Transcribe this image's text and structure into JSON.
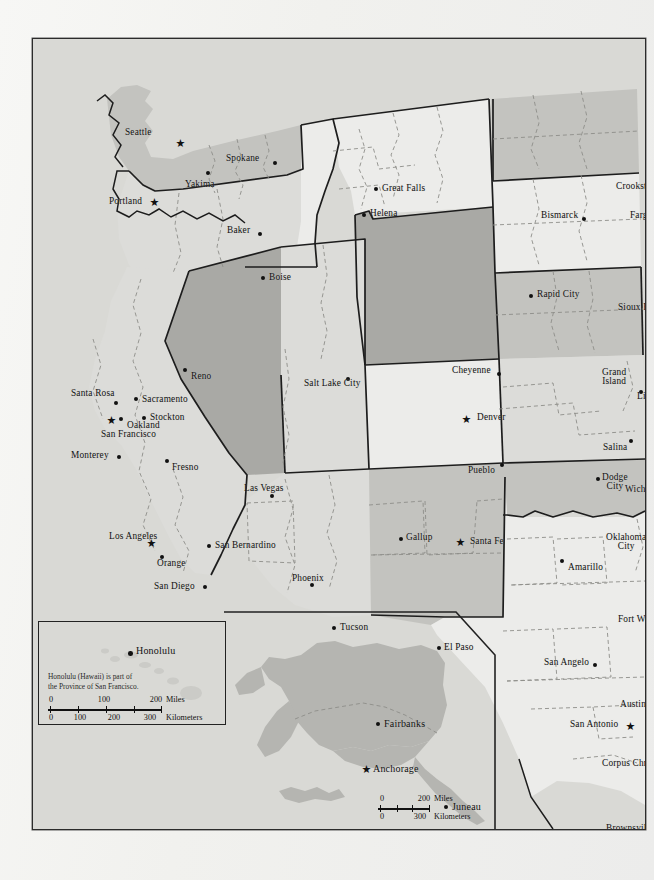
{
  "document": {
    "title": "Western United States Political Map",
    "type": "printed-atlas-page",
    "paper_color": "#f2f2ef",
    "frame_border_color": "#2b2b2b"
  },
  "palette": {
    "fill_lightest": "#ececea",
    "fill_light": "#dcdcd9",
    "fill_medium": "#c4c4c0",
    "fill_dark": "#a9a9a5",
    "base": "#d9d9d5",
    "ink": "#111111",
    "dashed_border": "#8a8a86"
  },
  "map": {
    "cities": [
      {
        "name": "Seattle",
        "x": 148,
        "y": 104,
        "marker": "star",
        "label_x": 92,
        "label_y": 89,
        "align": "left"
      },
      {
        "name": "Spokane",
        "x": 242,
        "y": 124,
        "marker": "dot",
        "label_x": 193,
        "label_y": 115,
        "align": "left"
      },
      {
        "name": "Yakima",
        "x": 175,
        "y": 134,
        "marker": "dot",
        "label_x": 152,
        "label_y": 141,
        "align": "left"
      },
      {
        "name": "Portland",
        "x": 122,
        "y": 163,
        "marker": "star",
        "label_x": 76,
        "label_y": 158,
        "align": "left"
      },
      {
        "name": "Baker",
        "x": 227,
        "y": 195,
        "marker": "dot",
        "label_x": 194,
        "label_y": 187,
        "align": "left"
      },
      {
        "name": "Boise",
        "x": 230,
        "y": 239,
        "marker": "dot",
        "label_x": 236,
        "label_y": 234,
        "align": "left"
      },
      {
        "name": "Great Falls",
        "x": 343,
        "y": 150,
        "marker": "dot",
        "label_x": 349,
        "label_y": 145,
        "align": "left"
      },
      {
        "name": "Helena",
        "x": 331,
        "y": 176,
        "marker": "dot",
        "label_x": 337,
        "label_y": 170,
        "align": "left"
      },
      {
        "name": "Crookston",
        "x": 634,
        "y": 152,
        "marker": "dot",
        "label_x": 583,
        "label_y": 143,
        "align": "left"
      },
      {
        "name": "Bismarck",
        "x": 551,
        "y": 180,
        "marker": "dot",
        "label_x": 508,
        "label_y": 172,
        "align": "left"
      },
      {
        "name": "Fargo",
        "x": 628,
        "y": 180,
        "marker": "dot",
        "label_x": 597,
        "label_y": 172,
        "align": "left"
      },
      {
        "name": "Rapid City",
        "x": 498,
        "y": 257,
        "marker": "dot",
        "label_x": 504,
        "label_y": 251,
        "align": "left"
      },
      {
        "name": "Sioux Falls",
        "x": 638,
        "y": 272,
        "marker": "dot",
        "label_x": 585,
        "label_y": 264,
        "align": "left"
      },
      {
        "name": "Cheyenne",
        "x": 466,
        "y": 335,
        "marker": "dot",
        "label_x": 419,
        "label_y": 327,
        "align": "left"
      },
      {
        "name": "Grand\nIsland",
        "x": 608,
        "y": 353,
        "marker": "dot",
        "label_x": 569,
        "label_y": 329,
        "align": "left"
      },
      {
        "name": "Lincoln",
        "x": 639,
        "y": 350,
        "marker": "dot",
        "label_x": 604,
        "label_y": 353,
        "align": "left"
      },
      {
        "name": "Denver",
        "x": 434,
        "y": 380,
        "marker": "star",
        "label_x": 444,
        "label_y": 374,
        "align": "left"
      },
      {
        "name": "Pueblo",
        "x": 469,
        "y": 426,
        "marker": "dot",
        "label_x": 435,
        "label_y": 427,
        "align": "left"
      },
      {
        "name": "Salina",
        "x": 598,
        "y": 402,
        "marker": "dot",
        "label_x": 570,
        "label_y": 404,
        "align": "left"
      },
      {
        "name": "Dodge\nCity",
        "x": 565,
        "y": 440,
        "marker": "dot",
        "label_x": 569,
        "label_y": 434,
        "align": "left"
      },
      {
        "name": "Wichita",
        "x": 627,
        "y": 445,
        "marker": "dot",
        "label_x": 592,
        "label_y": 446,
        "align": "left"
      },
      {
        "name": "Salt Lake City",
        "x": 315,
        "y": 340,
        "marker": "dot",
        "label_x": 271,
        "label_y": 340,
        "align": "left"
      },
      {
        "name": "Reno",
        "x": 152,
        "y": 331,
        "marker": "dot",
        "label_x": 158,
        "label_y": 333,
        "align": "left"
      },
      {
        "name": "Santa Rosa",
        "x": 83,
        "y": 364,
        "marker": "dot",
        "label_x": 38,
        "label_y": 350,
        "align": "left"
      },
      {
        "name": "Sacramento",
        "x": 103,
        "y": 360,
        "marker": "dot",
        "label_x": 109,
        "label_y": 356,
        "align": "left"
      },
      {
        "name": "Stockton",
        "x": 111,
        "y": 379,
        "marker": "dot",
        "label_x": 117,
        "label_y": 374,
        "align": "left"
      },
      {
        "name": "Oakland",
        "x": 88,
        "y": 380,
        "marker": "dot",
        "label_x": 94,
        "label_y": 382,
        "align": "left"
      },
      {
        "name": "San Francisco",
        "x": 79,
        "y": 381,
        "marker": "star",
        "label_x": 68,
        "label_y": 391,
        "align": "left"
      },
      {
        "name": "Monterey",
        "x": 86,
        "y": 418,
        "marker": "dot",
        "label_x": 38,
        "label_y": 412,
        "align": "left"
      },
      {
        "name": "Fresno",
        "x": 134,
        "y": 422,
        "marker": "dot",
        "label_x": 139,
        "label_y": 424,
        "align": "left"
      },
      {
        "name": "Las Vegas",
        "x": 239,
        "y": 457,
        "marker": "dot",
        "label_x": 211,
        "label_y": 445,
        "align": "left"
      },
      {
        "name": "Los Angeles",
        "x": 119,
        "y": 504,
        "marker": "star",
        "label_x": 76,
        "label_y": 493,
        "align": "left"
      },
      {
        "name": "San Bernardino",
        "x": 176,
        "y": 507,
        "marker": "dot",
        "label_x": 182,
        "label_y": 502,
        "align": "left"
      },
      {
        "name": "Orange",
        "x": 129,
        "y": 518,
        "marker": "dot",
        "label_x": 124,
        "label_y": 520,
        "align": "left"
      },
      {
        "name": "San Diego",
        "x": 172,
        "y": 548,
        "marker": "dot",
        "label_x": 121,
        "label_y": 543,
        "align": "left"
      },
      {
        "name": "Phoenix",
        "x": 279,
        "y": 546,
        "marker": "dot",
        "label_x": 259,
        "label_y": 535,
        "align": "left"
      },
      {
        "name": "Tucson",
        "x": 301,
        "y": 589,
        "marker": "dot",
        "label_x": 307,
        "label_y": 584,
        "align": "left"
      },
      {
        "name": "Gallup",
        "x": 368,
        "y": 500,
        "marker": "dot",
        "label_x": 373,
        "label_y": 494,
        "align": "left"
      },
      {
        "name": "Santa Fe",
        "x": 428,
        "y": 503,
        "marker": "star",
        "label_x": 437,
        "label_y": 498,
        "align": "left"
      },
      {
        "name": "Amarillo",
        "x": 529,
        "y": 522,
        "marker": "dot",
        "label_x": 535,
        "label_y": 524,
        "align": "left"
      },
      {
        "name": "Oklahoma\nCity",
        "x": 625,
        "y": 499,
        "marker": "star",
        "label_x": 573,
        "label_y": 494,
        "align": "left"
      },
      {
        "name": "El Paso",
        "x": 406,
        "y": 609,
        "marker": "dot",
        "label_x": 411,
        "label_y": 604,
        "align": "left"
      },
      {
        "name": "Fort Worth",
        "x": 645,
        "y": 584,
        "marker": "dot",
        "label_x": 585,
        "label_y": 576,
        "align": "left"
      },
      {
        "name": "San Angelo",
        "x": 562,
        "y": 626,
        "marker": "dot",
        "label_x": 511,
        "label_y": 619,
        "align": "left"
      },
      {
        "name": "Austin",
        "x": 618,
        "y": 668,
        "marker": "dot",
        "label_x": 587,
        "label_y": 661,
        "align": "left"
      },
      {
        "name": "San Antonio",
        "x": 598,
        "y": 687,
        "marker": "star",
        "label_x": 537,
        "label_y": 681,
        "align": "left"
      },
      {
        "name": "Corpus Christi",
        "x": 628,
        "y": 727,
        "marker": "dot",
        "label_x": 569,
        "label_y": 720,
        "align": "left"
      },
      {
        "name": "Brownsville",
        "x": 628,
        "y": 783,
        "marker": "dot",
        "label_x": 573,
        "label_y": 785,
        "align": "left"
      }
    ]
  },
  "hawaii_inset": {
    "name": "Hawaii inset",
    "city": {
      "name": "Honolulu",
      "x": 92,
      "y": 32
    },
    "note": "Honolulu (Hawaii) is part of\nthe Province of San Francisco.",
    "scale": {
      "miles": {
        "ticks": [
          "0",
          "100",
          "200"
        ],
        "unit": "Miles"
      },
      "kilometers": {
        "ticks": [
          "0",
          "100",
          "200",
          "300"
        ],
        "unit": "Kilometers"
      }
    }
  },
  "alaska_inset": {
    "name": "Alaska inset",
    "cities": [
      {
        "name": "Fairbanks",
        "x": 154,
        "y": 113,
        "marker": "dot"
      },
      {
        "name": "Anchorage",
        "x": 143,
        "y": 158,
        "marker": "star"
      },
      {
        "name": "Juneau",
        "x": 222,
        "y": 196,
        "marker": "dot"
      }
    ],
    "scale": {
      "miles": {
        "ticks": [
          "0",
          "200"
        ],
        "unit": "Miles"
      },
      "kilometers": {
        "ticks": [
          "0",
          "300"
        ],
        "unit": "Kilometers"
      }
    }
  }
}
